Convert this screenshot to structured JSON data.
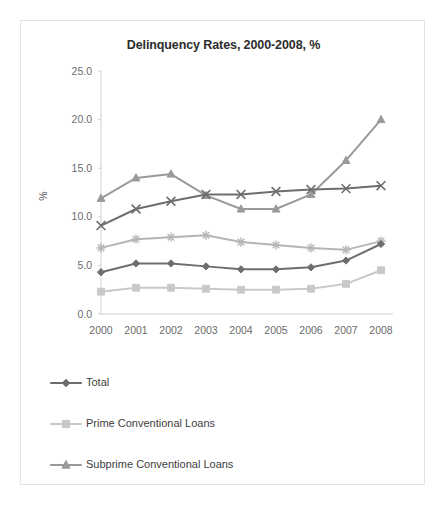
{
  "chart_data": {
    "type": "line",
    "title": "Delinquency Rates, 2000-2008, %",
    "xlabel": "",
    "ylabel": "%",
    "categories": [
      "2000",
      "2001",
      "2002",
      "2003",
      "2004",
      "2005",
      "2006",
      "2007",
      "2008"
    ],
    "ylim": [
      0.0,
      25.0
    ],
    "ytick_labels": [
      "0.0",
      "5.0",
      "10.0",
      "15.0",
      "20.0",
      "25.0"
    ],
    "ytick_values": [
      0.0,
      5.0,
      10.0,
      15.0,
      20.0,
      25.0
    ],
    "grid": false,
    "legend_position": "bottom-left",
    "series": [
      {
        "name": "Total",
        "marker": "diamond",
        "color": "#6e6e6e",
        "in_legend": true,
        "values": [
          4.3,
          5.2,
          5.2,
          4.9,
          4.6,
          4.6,
          4.8,
          5.5,
          7.2
        ]
      },
      {
        "name": "Prime Conventional Loans",
        "marker": "square",
        "color": "#c9c9c9",
        "in_legend": true,
        "values": [
          2.3,
          2.7,
          2.7,
          2.6,
          2.5,
          2.5,
          2.6,
          3.1,
          4.5
        ]
      },
      {
        "name": "Subprime Conventional Loans",
        "marker": "triangle",
        "color": "#9a9a9a",
        "in_legend": true,
        "values": [
          11.9,
          14.0,
          14.4,
          12.2,
          10.8,
          10.8,
          12.3,
          15.8,
          20.0
        ]
      },
      {
        "name": "series-x",
        "marker": "cross",
        "color": "#6e6e6e",
        "in_legend": false,
        "values": [
          9.1,
          10.8,
          11.6,
          12.3,
          12.3,
          12.6,
          12.8,
          12.9,
          13.2
        ]
      },
      {
        "name": "series-star",
        "marker": "star",
        "color": "#b5b5b5",
        "in_legend": false,
        "values": [
          6.8,
          7.7,
          7.9,
          8.1,
          7.4,
          7.1,
          6.8,
          6.6,
          7.5
        ]
      }
    ],
    "legend_entries": [
      {
        "label": "Total",
        "marker": "diamond",
        "color": "#6e6e6e"
      },
      {
        "label": "Prime Conventional Loans",
        "marker": "square",
        "color": "#c9c9c9"
      },
      {
        "label": "Subprime Conventional Loans",
        "marker": "triangle",
        "color": "#9a9a9a"
      }
    ]
  }
}
